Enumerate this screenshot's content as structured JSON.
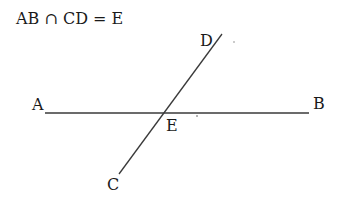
{
  "caption": "AB ∩ CD = E",
  "points": {
    "A": {
      "label": "A"
    },
    "B": {
      "label": "B"
    },
    "C": {
      "label": "C"
    },
    "D": {
      "label": "D"
    },
    "E": {
      "label": "E"
    }
  },
  "lines": [
    {
      "name": "AB",
      "from": "A",
      "to": "B"
    },
    {
      "name": "CD",
      "from": "C",
      "to": "D"
    }
  ],
  "colors": {
    "stroke": "#3a3a3a",
    "text": "#1a1a1a"
  }
}
